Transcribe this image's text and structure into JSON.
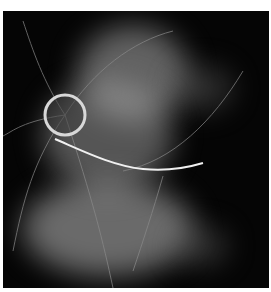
{
  "image": {
    "subject": "fundus angiogram (grayscale)",
    "background": "#050505",
    "page_background": "#ffffff",
    "features": {
      "optic_disc": {
        "cx": 62,
        "cy": 104,
        "r": 20
      },
      "bright_vessel": "diagonal from optic disc toward lower right"
    }
  }
}
